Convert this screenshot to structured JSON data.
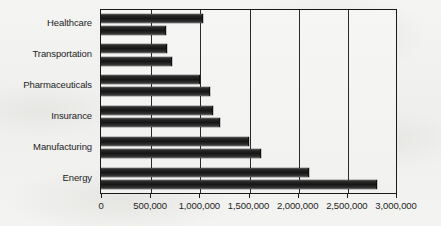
{
  "chart_data": {
    "type": "bar",
    "orientation": "horizontal",
    "title": "",
    "xlabel": "",
    "ylabel": "",
    "xlim": [
      0,
      3000000
    ],
    "xticks": [
      0,
      500000,
      1000000,
      1500000,
      2000000,
      2500000,
      3000000
    ],
    "xtick_labels": [
      "0",
      "500,000",
      "1,000,000",
      "1,500,000",
      "2,000,000",
      "2,500,000",
      "3,000,000"
    ],
    "grid": true,
    "grid_axis": "x",
    "legend": false,
    "legend_position": "none",
    "categories": [
      "Healthcare",
      "Transportation",
      "Pharmaceuticals",
      "Insurance",
      "Manufacturing",
      "Energy"
    ],
    "series": [
      {
        "name": "Series 1",
        "values": [
          1030000,
          660000,
          1000000,
          1130000,
          1490000,
          2100000
        ]
      },
      {
        "name": "Series 2",
        "values": [
          650000,
          710000,
          1100000,
          1200000,
          1620000,
          2800000
        ]
      }
    ],
    "bar_color": "#1a1a1a",
    "plot_background": "#f4f4f2"
  },
  "axis": {
    "tick_labels": [
      "0",
      "500,000",
      "1,000,000",
      "1,500,000",
      "2,000,000",
      "2,500,000",
      "3,000,000"
    ]
  },
  "categories": {
    "healthcare": "Healthcare",
    "transportation": "Transportation",
    "pharmaceuticals": "Pharmaceuticals",
    "insurance": "Insurance",
    "manufacturing": "Manufacturing",
    "energy": "Energy"
  }
}
